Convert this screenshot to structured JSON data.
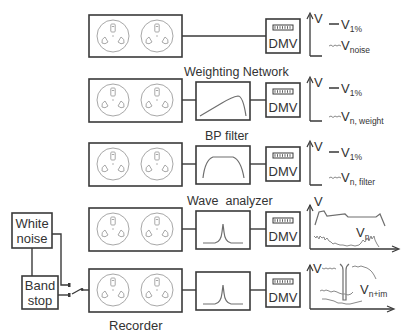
{
  "diagram": {
    "type": "measurement-setup-block-diagram",
    "colors": {
      "stroke": "#3a3a3a",
      "reel": "#a8a8a8",
      "text": "#333333",
      "background": "#ffffff"
    },
    "rows": [
      {
        "id": "row-1",
        "filter_label": "",
        "filter_shape": "none",
        "meter_label": "DMV",
        "legend": [
          {
            "symbol": "solid-dash",
            "label_main": "V",
            "label_sub": "1%"
          },
          {
            "symbol": "noisy-dash",
            "label_main": "V",
            "label_sub": "noise"
          }
        ],
        "axis_label": "V"
      },
      {
        "id": "row-2",
        "filter_label": "Weighting Network",
        "filter_shape": "weighting-curve",
        "meter_label": "DMV",
        "legend": [
          {
            "symbol": "solid-dash",
            "label_main": "V",
            "label_sub": "1%"
          },
          {
            "symbol": "noisy-dash",
            "label_main": "V",
            "label_sub": "n, weight"
          }
        ],
        "axis_label": "V"
      },
      {
        "id": "row-3",
        "filter_label": "BP filter",
        "filter_shape": "bandpass-curve",
        "meter_label": "DMV",
        "legend": [
          {
            "symbol": "solid-dash",
            "label_main": "V",
            "label_sub": "1%"
          },
          {
            "symbol": "noisy-dash",
            "label_main": "V",
            "label_sub": "n, filter"
          }
        ],
        "axis_label": "V"
      },
      {
        "id": "row-4",
        "filter_label": "Wave  analyzer",
        "filter_shape": "narrow-peak",
        "meter_label": "DMV",
        "spectrum_label_main": "V",
        "spectrum_label_sub": "n",
        "axis_label": "V"
      },
      {
        "id": "row-5",
        "filter_label": "",
        "filter_shape": "narrow-peak",
        "meter_label": "DMV",
        "spectrum_label_top": "V",
        "spectrum_label_main": "V",
        "spectrum_label_sub": "n+im",
        "recorder_label": "Recorder"
      }
    ],
    "sources": {
      "white_noise": {
        "line1": "White",
        "line2": "noise"
      },
      "band_stop": {
        "line1": "Band",
        "line2": "stop"
      }
    }
  }
}
